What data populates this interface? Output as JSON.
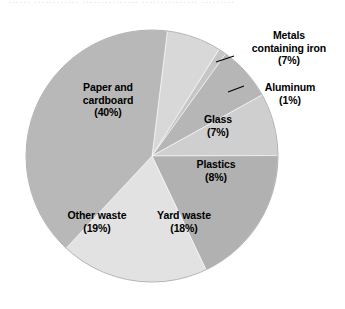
{
  "figure": {
    "background_color": "#ffffff",
    "top_bleed_text": "…… ………… …………… …………… ………"
  },
  "chart_data": {
    "type": "pie",
    "title": "",
    "subtitle": "",
    "xlabel": "",
    "ylabel": "",
    "grid": false,
    "legend": "none",
    "label_format": "name (value%)",
    "center": {
      "x": 152,
      "y": 156
    },
    "radius": 126,
    "start_angle_deg": -83,
    "direction": "clockwise",
    "categories": [
      "Metals containing iron",
      "Aluminum",
      "Glass",
      "Plastics",
      "Yard waste",
      "Other waste",
      "Paper and cardboard"
    ],
    "values": [
      7,
      1,
      7,
      8,
      18,
      19,
      40
    ],
    "units": "percent",
    "total": 100,
    "colors": [
      "#d8d8d8",
      "#c6c6c6",
      "#b6b6b6",
      "#cfcfcf",
      "#b1b1b1",
      "#e2e2e2",
      "#b8b8b8"
    ],
    "slices": [
      {
        "name": "Metals containing iron",
        "value": 7,
        "label": "Metals containing iron",
        "percent_label": "(7%)",
        "color": "#d8d8d8",
        "label_placement": "outside"
      },
      {
        "name": "Aluminum",
        "value": 1,
        "label": "Aluminum",
        "percent_label": "(1%)",
        "color": "#c6c6c6",
        "label_placement": "outside"
      },
      {
        "name": "Glass",
        "value": 7,
        "label": "Glass",
        "percent_label": "(7%)",
        "color": "#b6b6b6",
        "label_placement": "inside"
      },
      {
        "name": "Plastics",
        "value": 8,
        "label": "Plastics",
        "percent_label": "(8%)",
        "color": "#cfcfcf",
        "label_placement": "inside"
      },
      {
        "name": "Yard waste",
        "value": 18,
        "label": "Yard waste",
        "percent_label": "(18%)",
        "color": "#b1b1b1",
        "label_placement": "inside"
      },
      {
        "name": "Other waste",
        "value": 19,
        "label": "Other waste",
        "percent_label": "(19%)",
        "color": "#e2e2e2",
        "label_placement": "inside"
      },
      {
        "name": "Paper and cardboard",
        "value": 40,
        "label": "Paper and cardboard",
        "percent_label": "(40%)",
        "color": "#b8b8b8",
        "label_placement": "inside"
      }
    ]
  },
  "labels": {
    "paper": {
      "line1": "Paper and",
      "line2": "cardboard",
      "pct": "(40%)"
    },
    "glass": {
      "line1": "Glass",
      "pct": "(7%)"
    },
    "plastics": {
      "line1": "Plastics",
      "pct": "(8%)"
    },
    "yard": {
      "line1": "Yard waste",
      "pct": "(18%)"
    },
    "other": {
      "line1": "Other waste",
      "pct": "(19%)"
    },
    "metals": {
      "line1": "Metals",
      "line2": "containing iron",
      "pct": "(7%)"
    },
    "aluminum": {
      "line1": "Aluminum",
      "pct": "(1%)"
    }
  }
}
